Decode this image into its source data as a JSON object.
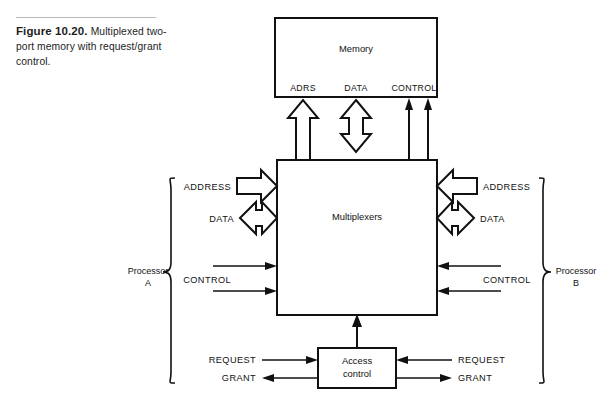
{
  "figure": {
    "number": "Figure 10.20.",
    "caption": "Multiplexed two-port memory with request/grant control."
  },
  "blocks": {
    "memory": {
      "label": "Memory"
    },
    "multiplexers": {
      "label": "Multiplexers"
    },
    "access_control": {
      "label_line1": "Access",
      "label_line2": "control"
    }
  },
  "memory_ports": {
    "address": "ADRS",
    "data": "DATA",
    "control": "CONTROL"
  },
  "processor_a": {
    "name_line1": "Processor",
    "name_line2": "A",
    "signals": {
      "address": "ADDRESS",
      "data": "DATA",
      "control": "CONTROL",
      "request": "REQUEST",
      "grant": "GRANT"
    }
  },
  "processor_b": {
    "name_line1": "Processor",
    "name_line2": "B",
    "signals": {
      "address": "ADDRESS",
      "data": "DATA",
      "control": "CONTROL",
      "request": "REQUEST",
      "grant": "GRANT"
    }
  },
  "colors": {
    "line": "#111111",
    "background": "#ffffff",
    "rule": "#b9b9b9"
  }
}
